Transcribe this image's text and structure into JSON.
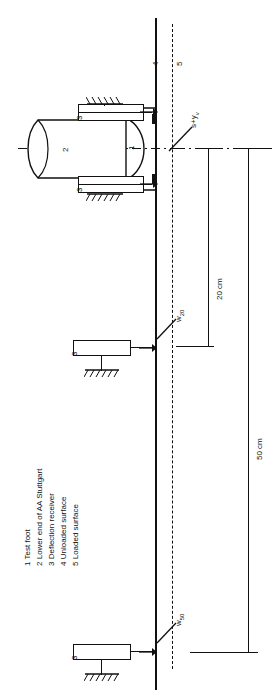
{
  "figure": {
    "type": "engineering-diagram",
    "orientation": "rotated-90",
    "line_color": "#111111",
    "background": "#ffffff"
  },
  "labels": {
    "part_1": "1",
    "part_2": "2",
    "part_3_top": "3",
    "part_3_bottom": "3",
    "part_3_middle": "3",
    "part_3_lower": "3",
    "part_4": "4",
    "part_5": "5"
  },
  "deflection_labels": {
    "top": "s+y",
    "top_sub": "v",
    "middle": "w",
    "middle_sub": "20",
    "bottom": "w",
    "bottom_sub": "50"
  },
  "dimensions": [
    {
      "id": "dim-20",
      "text": "20 cm"
    },
    {
      "id": "dim-50",
      "text": "50 cm"
    }
  ],
  "legend": {
    "items": [
      {
        "num": "1",
        "text": "Test foot"
      },
      {
        "num": "2",
        "text": "Lower end of AA Stuttgart"
      },
      {
        "num": "3",
        "text": "Deflection receiver"
      },
      {
        "num": "4",
        "text": "Unloaded surface"
      },
      {
        "num": "5",
        "text": "Loaded surface"
      }
    ]
  }
}
